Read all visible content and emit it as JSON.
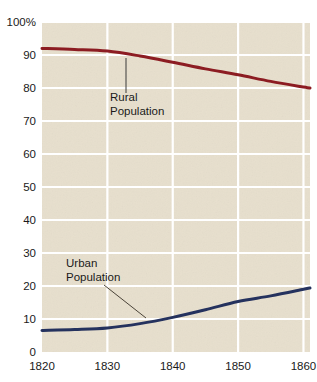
{
  "chart_data": {
    "type": "line",
    "title": "",
    "subtitle": "",
    "xlabel": "",
    "ylabel": "",
    "xlim": [
      1820,
      1861
    ],
    "ylim": [
      0,
      100
    ],
    "grid": true,
    "legend_position": "inline-annotations",
    "background_color": "#e7dfcd",
    "gridline_color": "#ffffff",
    "x_ticks": [
      1820,
      1830,
      1840,
      1850,
      1860
    ],
    "x_tick_labels": [
      "1820",
      "1830",
      "1840",
      "1850",
      "1860"
    ],
    "y_ticks": [
      0,
      10,
      20,
      30,
      40,
      50,
      60,
      70,
      80,
      90,
      100
    ],
    "y_tick_labels": [
      "0",
      "10",
      "20",
      "30",
      "40",
      "50",
      "60",
      "70",
      "80",
      "90",
      "100%"
    ],
    "x": [
      1820,
      1825,
      1830,
      1835,
      1840,
      1845,
      1850,
      1855,
      1860,
      1861
    ],
    "series": [
      {
        "name": "Rural Population",
        "color": "#8c1c22",
        "values": [
          92.0,
          91.7,
          91.2,
          89.7,
          87.8,
          85.8,
          84.0,
          82.0,
          80.3,
          80.0
        ]
      },
      {
        "name": "Urban Population",
        "color": "#25325e",
        "values": [
          6.5,
          6.8,
          7.3,
          8.6,
          10.5,
          12.8,
          15.3,
          17.0,
          19.0,
          19.4
        ]
      }
    ],
    "annotations": [
      {
        "label_line1": "Rural",
        "label_line2": "Population",
        "label_x": 110,
        "label_y": 101,
        "leader": {
          "x1": 126,
          "y1": 58,
          "x2": 126,
          "y2": 93
        },
        "leader_color": "#3a3a3a"
      },
      {
        "label_line1": "Urban",
        "label_line2": "Population",
        "label_x": 66,
        "label_y": 267,
        "leader": {
          "x1": 104,
          "y1": 285,
          "x2": 146,
          "y2": 318
        },
        "leader_color": "#4a4338"
      }
    ]
  },
  "layout": {
    "plot_left": 42,
    "plot_right": 310,
    "plot_top": 22,
    "plot_bottom": 352
  }
}
